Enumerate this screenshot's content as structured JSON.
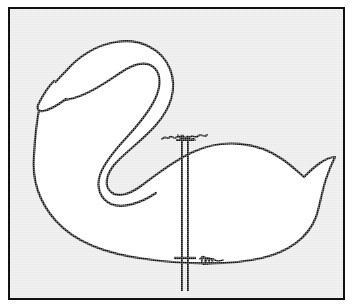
{
  "page": {
    "title": "Swan Lawn Ornament Pattern",
    "caption": "",
    "background_color": "#ffffff"
  },
  "frame": {
    "border_color": "#111111",
    "border_width_px": 2,
    "fill_color": "#e9e9e9",
    "x": 8,
    "y": 7,
    "width": 337,
    "height": 293
  },
  "diagram": {
    "type": "line-drawing",
    "subject": "swan",
    "view": "side profile facing left",
    "outline_color": "#111111",
    "fill_color": "#ffffff",
    "stroke_width_px": 2,
    "parts": [
      {
        "name": "head",
        "description": "rounded head at upper left"
      },
      {
        "name": "beak",
        "description": "pointed wedge beak angled down-left"
      },
      {
        "name": "neck",
        "description": "S-curved neck sweeping from head down to body"
      },
      {
        "name": "body",
        "description": "large oval body"
      },
      {
        "name": "tail",
        "description": "pointed notched tail at right"
      }
    ]
  },
  "mounting_stake": {
    "name": "support-stake",
    "description": "double-line vertical rod passing through the body",
    "color": "#111111",
    "top_y": 134,
    "bottom_y": 289,
    "center_x": 183,
    "rail_offset_px": 3,
    "details": [
      {
        "name": "top-wire-wrap",
        "description": "coiled wire wrap where stake meets the back",
        "x": 183,
        "y": 137
      },
      {
        "name": "bottom-wire-wrap",
        "description": "coiled wire wrap at the belly line",
        "x": 205,
        "y": 256
      },
      {
        "name": "top-crossbar",
        "description": "short horizontal tick at top attachment",
        "x": 183,
        "y": 139
      },
      {
        "name": "bottom-crossbar",
        "description": "short horizontal tick at belly attachment",
        "x": 183,
        "y": 256
      }
    ]
  },
  "colors": {
    "ink": "#111111",
    "paper": "#e9e9e9",
    "figure_fill": "#ffffff",
    "page": "#ffffff"
  }
}
